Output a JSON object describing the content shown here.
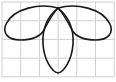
{
  "figure": {
    "grid": {
      "columns": 6,
      "rows": 4,
      "x0": 2,
      "y0": 2,
      "cell": 18.7,
      "line_color": "#cfcfcf"
    },
    "curve": {
      "stroke_color": "#1a1a1a",
      "stroke_width": 1.6,
      "petals": [
        {
          "name": "left",
          "path": "M58,8 C40,3 14,8 6,24 C2,33 8,40 20,40 C32,40 40,37 44,30 C48,22 54,12 58,8 Z"
        },
        {
          "name": "right",
          "path": "M58,8 C76,3 102,8 110,24 C114,33 108,40 96,40 C84,40 76,37 72,30 C68,22 62,12 58,8 Z"
        },
        {
          "name": "bottom",
          "path": "M58,8 C48,16 42,28 43,44 C44,60 52,72 58,73 C64,72 72,60 73,44 C74,28 68,16 58,8 Z"
        }
      ]
    }
  }
}
